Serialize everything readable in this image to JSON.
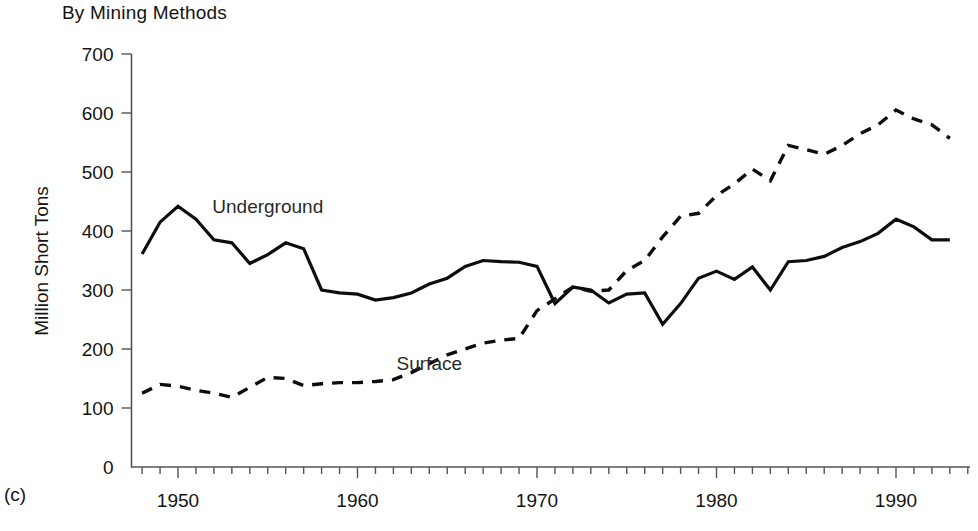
{
  "figure": {
    "title": "By Mining Methods",
    "panel_label": "(c)",
    "y_axis_title": "Million Short Tons",
    "series_labels": {
      "underground": "Underground",
      "surface": "Surface"
    }
  },
  "chart_data": {
    "type": "line",
    "title": "By Mining Methods",
    "xlabel": "",
    "ylabel": "Million Short Tons",
    "xlim": [
      1948,
      1994
    ],
    "ylim": [
      0,
      700
    ],
    "yticks": [
      0,
      100,
      200,
      300,
      400,
      500,
      600,
      700
    ],
    "ytick_labels": [
      "0",
      "100",
      "200",
      "300",
      "400",
      "500",
      "600",
      "700"
    ],
    "xticks": [
      1950,
      1960,
      1970,
      1980,
      1990
    ],
    "xtick_labels": [
      "1950",
      "1960",
      "1970",
      "1980",
      "1990"
    ],
    "minor_xtick_interval": 1,
    "grid": false,
    "legend": "inline-annotations",
    "x": [
      1948,
      1949,
      1950,
      1951,
      1952,
      1953,
      1954,
      1955,
      1956,
      1957,
      1958,
      1959,
      1960,
      1961,
      1962,
      1963,
      1964,
      1965,
      1966,
      1967,
      1968,
      1969,
      1970,
      1971,
      1972,
      1973,
      1974,
      1975,
      1976,
      1977,
      1978,
      1979,
      1980,
      1981,
      1982,
      1983,
      1984,
      1985,
      1986,
      1987,
      1988,
      1989,
      1990,
      1991,
      1992,
      1993
    ],
    "series": [
      {
        "name": "Underground",
        "style": "solid",
        "annotation_x": 1955,
        "annotation_y": 430,
        "values": [
          361,
          415,
          442,
          420,
          385,
          380,
          345,
          360,
          380,
          370,
          300,
          295,
          293,
          283,
          287,
          295,
          310,
          320,
          340,
          350,
          348,
          347,
          340,
          277,
          305,
          300,
          278,
          293,
          295,
          242,
          277,
          320,
          332,
          318,
          339,
          300,
          348,
          350,
          357,
          372,
          382,
          396,
          420,
          407,
          385,
          385
        ]
      },
      {
        "name": "Surface",
        "style": "dashed",
        "annotation_x": 1964,
        "annotation_y": 165,
        "values": [
          125,
          140,
          137,
          130,
          125,
          118,
          135,
          152,
          150,
          138,
          141,
          143,
          143,
          145,
          148,
          160,
          175,
          190,
          200,
          210,
          215,
          218,
          265,
          285,
          305,
          298,
          300,
          333,
          350,
          390,
          425,
          430,
          460,
          480,
          505,
          485,
          545,
          538,
          530,
          545,
          565,
          580,
          605,
          590,
          580,
          557
        ]
      }
    ]
  }
}
